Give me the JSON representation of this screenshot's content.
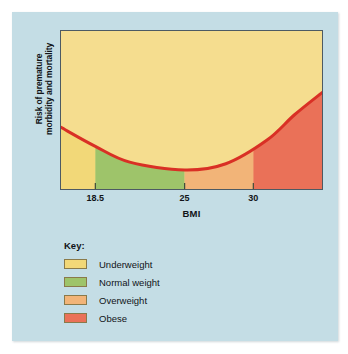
{
  "figure": {
    "background_color": "#c4dde5",
    "page_color": "#ffffff"
  },
  "chart_data": {
    "type": "area",
    "title": "",
    "subtitle": "",
    "xlabel": "BMI",
    "ylabel": "Risk of premature morbidity and mortality",
    "ylabel_lines": [
      "Risk of premature",
      "morbidity and mortality"
    ],
    "xlim": [
      16.0,
      35.0
    ],
    "ylim": [
      0,
      100
    ],
    "x_tick_labels": [
      "18.5",
      "25",
      "30"
    ],
    "x_tick_values": [
      18.5,
      25,
      30
    ],
    "y_tick_labels": [],
    "grid": false,
    "legend_position": "below-left",
    "curve": {
      "name": "Risk of premature morbidity and mortality",
      "color": "#d93025",
      "line_width": 3,
      "shape": "u-curve",
      "x": [
        16.0,
        18.5,
        21.0,
        25.0,
        28.0,
        31.0,
        33.0,
        35.0
      ],
      "y": [
        39,
        27,
        17,
        12,
        16,
        31,
        47,
        61
      ],
      "min_at_x": 25,
      "description": "J-shaped / U-shaped risk curve, minimum at BMI 25, rising steeply above BMI 30"
    },
    "bands": [
      {
        "label": "Underweight",
        "color": "#f2d878",
        "x_from": 16.0,
        "x_to": 18.5
      },
      {
        "label": "Normal weight",
        "color": "#9ec46a",
        "x_from": 18.5,
        "x_to": 25.0
      },
      {
        "label": "Overweight",
        "color": "#f2b478",
        "x_from": 25.0,
        "x_to": 30.0
      },
      {
        "label": "Obese",
        "color": "#ea7158",
        "x_from": 30.0,
        "x_to": 35.0
      }
    ],
    "area_above_curve_color": "#f5dd8f"
  },
  "legend": {
    "title": "Key:",
    "items": [
      {
        "label": "Underweight",
        "color": "#f2d878"
      },
      {
        "label": "Normal weight",
        "color": "#9ec46a"
      },
      {
        "label": "Overweight",
        "color": "#f2b478"
      },
      {
        "label": "Obese",
        "color": "#ea7158"
      }
    ]
  }
}
